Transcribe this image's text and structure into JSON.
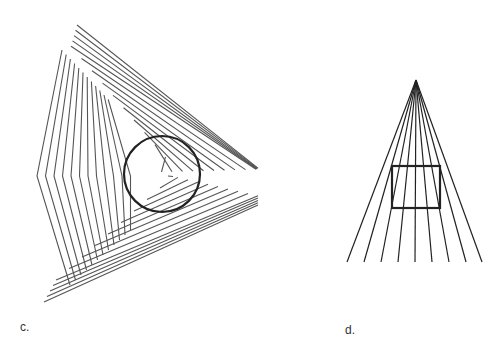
{
  "figures": [
    {
      "id": "c",
      "label": "c.",
      "description": "Nested chevron line pattern with a circle overlaid",
      "line_color": "#555555",
      "circle": {
        "cx": 162,
        "cy": 174,
        "r": 38,
        "stroke": "#222222",
        "width": 2.2
      }
    },
    {
      "id": "d",
      "label": "d.",
      "description": "Rays converging to an apex with a square overlaid",
      "line_color": "#222222",
      "apex": {
        "x": 416,
        "y": 80
      },
      "ray_end_y": 262,
      "ray_end_x": [
        347,
        364,
        381,
        398,
        415,
        432,
        449,
        466,
        482
      ],
      "square": {
        "x": 392,
        "y": 166,
        "w": 48,
        "h": 42,
        "stroke": "#222222",
        "width": 2.2
      }
    }
  ]
}
